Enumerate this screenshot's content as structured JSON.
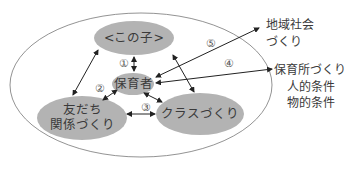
{
  "diagram": {
    "nodes": {
      "child": "<この子>",
      "caregiver": "保育者",
      "friends_line1": "友だち",
      "friends_line2": "関係づくり",
      "class": "クラスづくり"
    },
    "external": {
      "community_line1": "地域社会",
      "community_line2": "づくり",
      "nursery_line1": "保育所づくり",
      "nursery_line2": "人的条件",
      "nursery_line3": "物的条件"
    },
    "markers": [
      "①",
      "②",
      "③",
      "④",
      "⑤"
    ],
    "colors": {
      "node_fill": "#b3b3b3",
      "outline": "#555555",
      "arrow": "#222222"
    }
  }
}
